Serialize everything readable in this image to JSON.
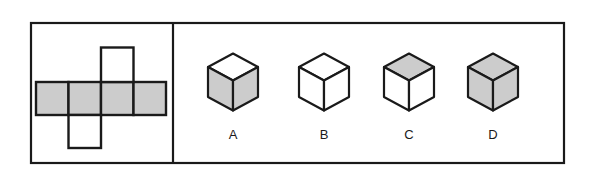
{
  "figure": {
    "background_color": "#ffffff",
    "frame": {
      "name": "outer-frame",
      "stroke_color": "#1a1a1a",
      "stroke_width": 2.2,
      "fill": "#ffffff",
      "x": 31,
      "y": 23,
      "width": 533,
      "height": 140
    },
    "divider": {
      "name": "vertical-divider",
      "stroke_color": "#1a1a1a",
      "stroke_width": 2.2,
      "x": 173,
      "y_top": 23,
      "y_bottom": 163
    }
  },
  "colors": {
    "gray_fill": "#cccccc",
    "white_fill": "#ffffff",
    "stroke": "#1a1a1a",
    "label_text": "#1a1a1a"
  },
  "net": {
    "name": "cube-net",
    "description": "Unfolded cube net: a horizontal row of four shaded squares with one white square above the third column and one white square below the second column",
    "cell_size": 32.5,
    "stroke_width": 2.4,
    "squares": [
      {
        "id": "row-1",
        "label": "row square 1",
        "x": 36.0,
        "y": 82.0,
        "w": 32.5,
        "h": 33.0,
        "fill": "gray"
      },
      {
        "id": "row-2",
        "label": "row square 2",
        "x": 68.5,
        "y": 82.0,
        "w": 32.5,
        "h": 33.0,
        "fill": "gray"
      },
      {
        "id": "row-3",
        "label": "row square 3",
        "x": 101.0,
        "y": 82.0,
        "w": 32.5,
        "h": 33.0,
        "fill": "gray"
      },
      {
        "id": "row-4",
        "label": "row square 4",
        "x": 133.5,
        "y": 82.0,
        "w": 32.5,
        "h": 33.0,
        "fill": "gray"
      },
      {
        "id": "top-flap",
        "label": "top square above column 3",
        "x": 101.0,
        "y": 47.5,
        "w": 32.5,
        "h": 34.5,
        "fill": "white"
      },
      {
        "id": "bottom-flap",
        "label": "bottom square below column 2",
        "x": 68.5,
        "y": 115.0,
        "w": 32.5,
        "h": 33.0,
        "fill": "white"
      }
    ]
  },
  "options": {
    "name": "cube-options",
    "count": 4,
    "cube_geometry": {
      "half_width": 25,
      "top_half_height": 13.5,
      "side_height": 30,
      "stroke_width": 2.2
    },
    "items": [
      {
        "label": "A",
        "center_x": 233,
        "center_y": 82,
        "label_x": 233,
        "label_y": 139,
        "faces": {
          "top": "white",
          "left": "gray",
          "right": "gray"
        }
      },
      {
        "label": "B",
        "center_x": 324,
        "center_y": 82,
        "label_x": 324,
        "label_y": 139,
        "faces": {
          "top": "white",
          "left": "white",
          "right": "white"
        }
      },
      {
        "label": "C",
        "center_x": 409,
        "center_y": 82,
        "label_x": 409,
        "label_y": 139,
        "faces": {
          "top": "gray",
          "left": "white",
          "right": "white"
        }
      },
      {
        "label": "D",
        "center_x": 493,
        "center_y": 82,
        "label_x": 493,
        "label_y": 139,
        "faces": {
          "top": "gray",
          "left": "gray",
          "right": "gray"
        }
      }
    ]
  }
}
